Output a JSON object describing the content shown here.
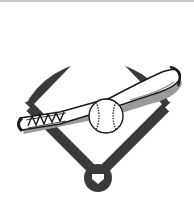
{
  "image": {
    "title": "Baseball diamond with bat and ball",
    "icons": [
      "baseball-field-icon",
      "baseball-bat-icon",
      "baseball-icon",
      "home-plate-icon",
      "base-icon"
    ]
  },
  "colors": {
    "field_dark": "#3a3a3a",
    "white": "#ffffff",
    "outline": "#1a1a1a",
    "shadow": "#9a9a9a",
    "top_border": "#c8c8c8"
  }
}
